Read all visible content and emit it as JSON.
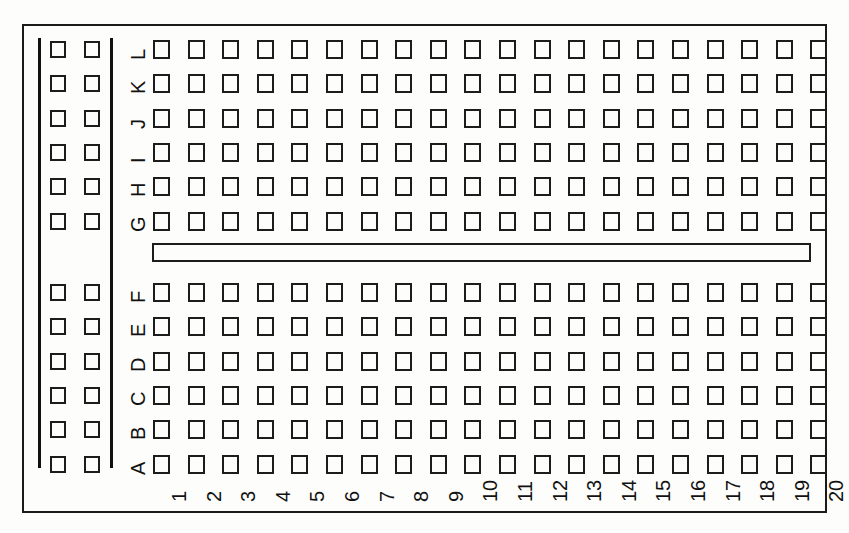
{
  "diagram": {
    "kind": "breadboard-layout",
    "background_color": "#fdfdfb",
    "line_color": "#1a1a1a"
  },
  "board": {
    "outline": {
      "x": 22,
      "y": 24,
      "width": 805,
      "height": 489
    }
  },
  "power_rail": {
    "name": "left-power-rail",
    "bus_line_count": 2,
    "hole_columns": 2,
    "group_hole_rows": 6,
    "groups": 2,
    "total_holes": 24
  },
  "center_channel": {
    "name": "center-channel",
    "x": 152,
    "y": 243,
    "width": 659,
    "height": 19
  },
  "grid": {
    "columns": 20,
    "rows": 12,
    "top_rows": [
      "L",
      "K",
      "J",
      "I",
      "H",
      "G"
    ],
    "bottom_rows": [
      "F",
      "E",
      "D",
      "C",
      "B",
      "A"
    ],
    "row_labels": [
      "L",
      "K",
      "J",
      "I",
      "H",
      "G",
      "F",
      "E",
      "D",
      "C",
      "B",
      "A"
    ],
    "column_labels": [
      "1",
      "2",
      "3",
      "4",
      "5",
      "6",
      "7",
      "8",
      "9",
      "10",
      "11",
      "12",
      "13",
      "14",
      "15",
      "16",
      "17",
      "18",
      "19",
      "20"
    ],
    "hole_start_x": 153,
    "hole_pitch_x": 34.6,
    "top_group_start_y": 40,
    "bottom_group_start_y": 283,
    "hole_pitch_y": 34.3
  }
}
